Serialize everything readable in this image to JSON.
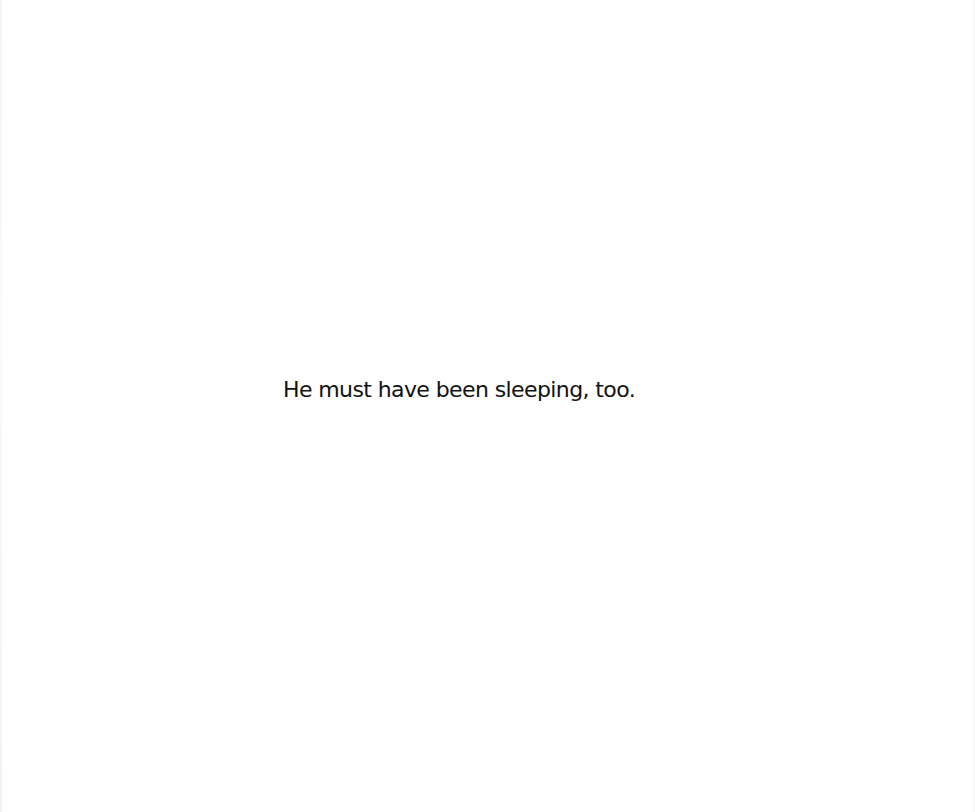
{
  "page": {
    "text": "He must have been sleeping, too.",
    "text_color": "#111111",
    "background_color": "#fefefe"
  }
}
